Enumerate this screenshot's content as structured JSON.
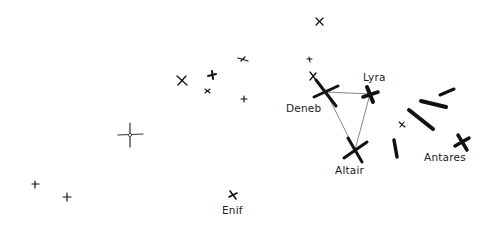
{
  "diagram": {
    "type": "star-map-sketch",
    "background": "#ffffff",
    "ink_color": "#111111",
    "line_color": "#777777",
    "labels": {
      "deneb": "Deneb",
      "lyra": "Lyra",
      "altair": "Altair",
      "antares": "Antares",
      "enif": "Enif"
    },
    "named_stars": [
      {
        "name": "Deneb",
        "x": 326,
        "y": 92,
        "size": "large"
      },
      {
        "name": "Lyra",
        "x": 370,
        "y": 95,
        "size": "large-bold"
      },
      {
        "name": "Altair",
        "x": 355,
        "y": 150,
        "size": "large"
      },
      {
        "name": "Antares",
        "x": 462,
        "y": 142,
        "size": "medium-bold"
      },
      {
        "name": "Enif",
        "x": 233,
        "y": 195,
        "size": "small"
      }
    ],
    "triangle": [
      "Deneb",
      "Lyra",
      "Altair"
    ],
    "unnamed_star_count": 12
  }
}
